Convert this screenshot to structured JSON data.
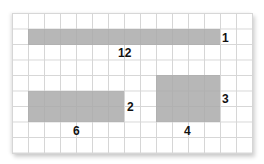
{
  "figure": {
    "grid": {
      "cell_px": 16,
      "color": "#d6d6d6"
    },
    "fill_color": "#aaaaaa",
    "shapes": [
      {
        "id": "top-bar",
        "width_units": 12,
        "height_units": 1,
        "width_label": "12",
        "height_label": "1"
      },
      {
        "id": "left-rect",
        "width_units": 6,
        "height_units": 2,
        "width_label": "6",
        "height_label": "2"
      },
      {
        "id": "right-rect",
        "width_units": 4,
        "height_units": 3,
        "width_label": "4",
        "height_label": "3"
      }
    ]
  }
}
